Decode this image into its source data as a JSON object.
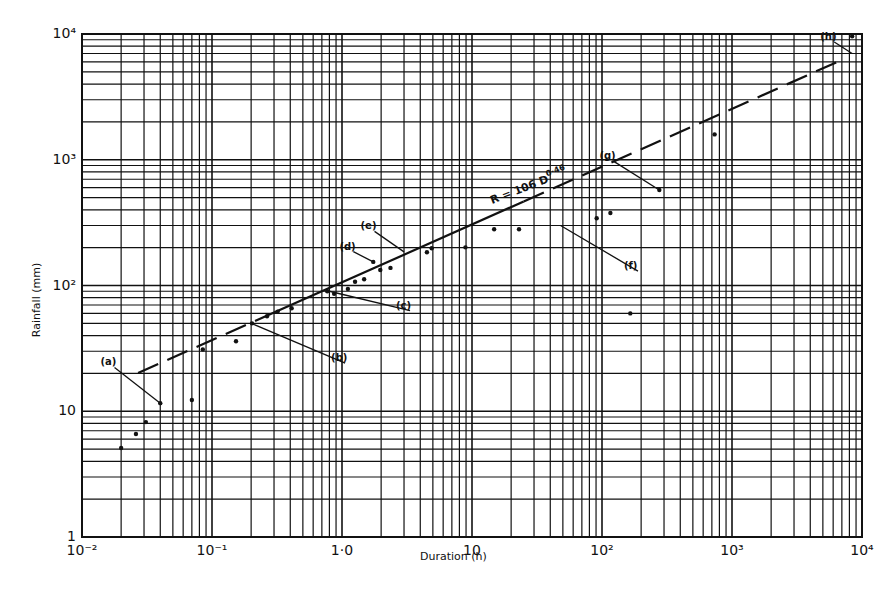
{
  "chart_data": {
    "type": "scatter",
    "title": "",
    "xlabel": "Duration (h)",
    "ylabel": "Rainfall (mm)",
    "xscale": "log",
    "yscale": "log",
    "xlim": [
      0.01,
      10000
    ],
    "ylim": [
      1,
      10000
    ],
    "grid": true,
    "x_ticks": [
      {
        "value": 0.01,
        "label": "10⁻²"
      },
      {
        "value": 0.1,
        "label": "10⁻¹"
      },
      {
        "value": 1,
        "label": "1·0"
      },
      {
        "value": 10,
        "label": "10"
      },
      {
        "value": 100,
        "label": "10²"
      },
      {
        "value": 1000,
        "label": "10³"
      },
      {
        "value": 10000,
        "label": "10⁴"
      }
    ],
    "y_ticks": [
      {
        "value": 1,
        "label": "1"
      },
      {
        "value": 10,
        "label": "10"
      },
      {
        "value": 100,
        "label": "10²"
      },
      {
        "value": 1000,
        "label": "10³"
      },
      {
        "value": 10000,
        "label": "10⁴"
      }
    ],
    "series": [
      {
        "name": "Observed world record rainfalls",
        "kind": "scatter",
        "x": [
          0.02,
          0.026,
          0.031,
          0.04,
          0.07,
          0.085,
          0.153,
          0.203,
          0.265,
          0.32,
          0.41,
          0.77,
          0.87,
          1.11,
          1.26,
          1.48,
          1.74,
          1.97,
          2.36,
          4.5,
          4.9,
          8.9,
          14.8,
          23,
          91,
          116,
          165,
          276,
          735,
          8400
        ],
        "y": [
          5.1,
          6.6,
          8.2,
          11.6,
          12.3,
          31,
          36,
          50,
          57,
          62,
          66,
          90,
          86,
          94,
          107,
          112,
          154,
          133,
          138,
          184,
          198,
          201,
          280,
          280,
          343,
          377,
          60,
          574,
          1590,
          9600
        ]
      },
      {
        "name": "Envelope fit",
        "kind": "line",
        "equation": "R = 106 D^0.46",
        "coefficient": 106,
        "exponent": 0.46,
        "solid_range": [
          0.3,
          25
        ],
        "dashed_ranges": [
          [
            0.027,
            0.3
          ],
          [
            25,
            6500
          ]
        ]
      }
    ],
    "annotations": [
      {
        "label": "(a)",
        "text_x": 0.016,
        "text_y": 24,
        "point_x": 0.04,
        "point_y": 11.6
      },
      {
        "label": "(b)",
        "text_x": 0.95,
        "text_y": 26,
        "point_x": 0.2,
        "point_y": 50
      },
      {
        "label": "(c)",
        "text_x": 3.0,
        "text_y": 68,
        "point_x": 0.8,
        "point_y": 90
      },
      {
        "label": "(d)",
        "text_x": 1.1,
        "text_y": 200,
        "point_x": 1.74,
        "point_y": 154
      },
      {
        "label": "(e)",
        "text_x": 1.6,
        "text_y": 290,
        "point_x": 3.0,
        "point_y": 185
      },
      {
        "label": "(f)",
        "text_x": 170,
        "text_y": 140,
        "point_x": 48,
        "point_y": 300
      },
      {
        "label": "(g)",
        "text_x": 110,
        "text_y": 1050,
        "point_x": 276,
        "point_y": 574
      },
      {
        "label": "(h)",
        "text_x": 5500,
        "text_y": 9300,
        "point_x": 8400,
        "point_y": 7000
      }
    ],
    "equation_label": {
      "text": "R = 106 D",
      "exponent": "0·46"
    }
  }
}
